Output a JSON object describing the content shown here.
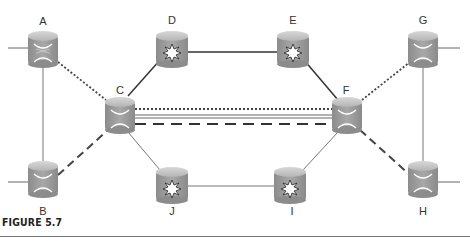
{
  "figure": {
    "caption": "FIGURE 5.7"
  },
  "nodes": [
    {
      "id": "A",
      "label": "A",
      "type": "cross-connect",
      "x": 43,
      "y": 53
    },
    {
      "id": "B",
      "label": "B",
      "type": "cross-connect",
      "x": 43,
      "y": 183
    },
    {
      "id": "C",
      "label": "C",
      "type": "cross-connect",
      "x": 120,
      "y": 117
    },
    {
      "id": "D",
      "label": "D",
      "type": "star-router",
      "x": 172,
      "y": 45
    },
    {
      "id": "E",
      "label": "E",
      "type": "star-router",
      "x": 293,
      "y": 45
    },
    {
      "id": "F",
      "label": "F",
      "type": "cross-connect",
      "x": 347,
      "y": 117
    },
    {
      "id": "G",
      "label": "G",
      "type": "cross-connect",
      "x": 423,
      "y": 53
    },
    {
      "id": "H",
      "label": "H",
      "type": "cross-connect",
      "x": 423,
      "y": 183
    },
    {
      "id": "I",
      "label": "I",
      "type": "star-router",
      "x": 290,
      "y": 186
    },
    {
      "id": "J",
      "label": "J",
      "type": "star-router",
      "x": 172,
      "y": 186
    }
  ],
  "links": [
    {
      "from": "A",
      "to": "B",
      "style": "thin"
    },
    {
      "from": "G",
      "to": "H",
      "style": "thin"
    },
    {
      "from": "A",
      "to": "C",
      "style": "dotted"
    },
    {
      "from": "B",
      "to": "C",
      "style": "dashed"
    },
    {
      "from": "C",
      "to": "D",
      "style": "solid"
    },
    {
      "from": "D",
      "to": "E",
      "style": "solid"
    },
    {
      "from": "E",
      "to": "F",
      "style": "solid"
    },
    {
      "from": "C",
      "to": "J",
      "style": "thin"
    },
    {
      "from": "J",
      "to": "I",
      "style": "thin"
    },
    {
      "from": "I",
      "to": "F",
      "style": "thin"
    },
    {
      "from": "F",
      "to": "G",
      "style": "dotted"
    },
    {
      "from": "F",
      "to": "H",
      "style": "dashed"
    },
    {
      "from": "C",
      "to": "F",
      "style": "dotted",
      "offset": -8
    },
    {
      "from": "C",
      "to": "F",
      "style": "double",
      "offset": -1
    },
    {
      "from": "C",
      "to": "F",
      "style": "dashed",
      "offset": 7
    }
  ],
  "stubs": [
    {
      "node": "A",
      "side": "left"
    },
    {
      "node": "B",
      "side": "left"
    },
    {
      "node": "G",
      "side": "right"
    },
    {
      "node": "H",
      "side": "right"
    }
  ],
  "colors": {
    "router_body": "#9a9a9a",
    "router_top": "#c8c8c8",
    "line": "#444444",
    "thin_line": "#777777"
  }
}
